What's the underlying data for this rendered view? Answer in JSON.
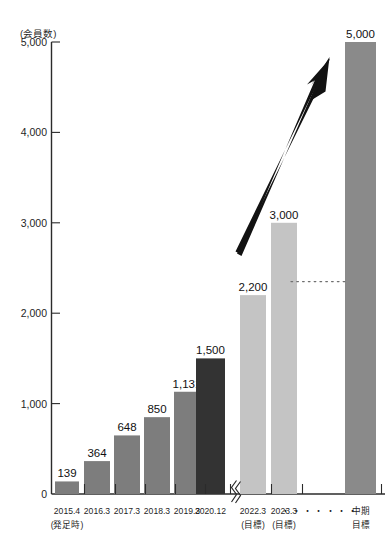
{
  "chart_data": {
    "type": "bar",
    "title": "",
    "subtitle": "",
    "xlabel": "",
    "ylabel": "(会員数)",
    "ylim": [
      0,
      5000
    ],
    "yticks": [
      0,
      1000,
      2000,
      3000,
      4000,
      5000
    ],
    "ytick_labels": [
      "0",
      "1,000",
      "2,000",
      "3,000",
      "4,000",
      "5,000"
    ],
    "grid": false,
    "legend": "none",
    "axis_break": true,
    "axis_break_note": "x-axis break between 2020.12 and 2022.3",
    "categories": [
      "2015.4",
      "2016.3",
      "2017.3",
      "2018.3",
      "2019.3",
      "2020.12",
      "2022.3",
      "2023.3",
      "中期"
    ],
    "category_sublabels": [
      "(発足時)",
      "",
      "",
      "",
      "",
      "",
      "(目標)",
      "(目標)",
      "目標"
    ],
    "values": [
      139,
      364,
      648,
      850,
      1131,
      1500,
      2200,
      3000,
      5000
    ],
    "value_labels": [
      "139",
      "364",
      "648",
      "850",
      "1,131",
      "1,500",
      "2,200",
      "3,000",
      "5,000"
    ],
    "series": [
      {
        "name": "会員数",
        "values": [
          139,
          364,
          648,
          850,
          1131,
          1500,
          2200,
          3000,
          5000
        ]
      }
    ],
    "bar_groups": [
      {
        "name": "actual",
        "indices": [
          0,
          1,
          2,
          3,
          4
        ],
        "color": "#7d7d7d"
      },
      {
        "name": "latest-actual",
        "indices": [
          5
        ],
        "color": "#333333"
      },
      {
        "name": "target",
        "indices": [
          6,
          7
        ],
        "color": "#c4c4c4"
      },
      {
        "name": "midterm-target",
        "indices": [
          8
        ],
        "color": "#8a8a8a"
      }
    ],
    "annotations": [
      {
        "name": "growth-arrow",
        "type": "arrow",
        "from": [
          2200,
          0
        ],
        "to": [
          5000,
          0
        ]
      },
      {
        "name": "midterm-dotted-connector",
        "type": "dotted-line",
        "value": 2350
      },
      {
        "name": "axis-ellipsis",
        "text": "・・・・・・・"
      }
    ]
  },
  "colors": {
    "bar_actual": "#7d7d7d",
    "bar_latest": "#333333",
    "bar_target": "#c4c4c4",
    "bar_midterm": "#8a8a8a",
    "axis": "#2b2b2b",
    "text": "#1a1a1a",
    "background": "#ffffff",
    "dotted": "#6f6f6f"
  },
  "axis": {
    "y_unit_label": "(会員数)",
    "zero_label": "0"
  },
  "ellipsis": {
    "between_targets": "・・・・・・・"
  }
}
